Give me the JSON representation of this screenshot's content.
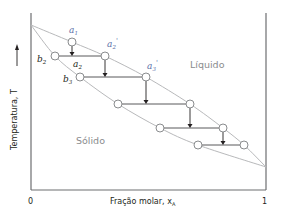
{
  "diagram": {
    "type": "phase-diagram",
    "title": "",
    "colors": {
      "axis": "#6d6e71",
      "curve": "#b8b9bb",
      "tie_line": "#58595b",
      "arrow": "#231f20",
      "point_fill": "#ffffff",
      "point_stroke": "#8a8c8e",
      "region_label": "#8a8c8e",
      "point_label_blue": "#5b6fa8",
      "point_label_black": "#231f20",
      "axis_label": "#231f20"
    },
    "axes": {
      "y_label": "Temperatura, T",
      "x_label_text": "Fração molar, x",
      "x_label_subscript": "A",
      "x_tick_min": "0",
      "x_tick_max": "1"
    },
    "regions": {
      "liquid": "Líquido",
      "solid": "Sólido"
    },
    "curves": {
      "liquidus": [
        [
          31,
          25
        ],
        [
          72,
          42
        ],
        [
          105,
          56
        ],
        [
          146,
          77
        ],
        [
          190,
          104
        ],
        [
          223,
          128
        ],
        [
          244,
          145
        ],
        [
          266,
          167
        ]
      ],
      "solidus": [
        [
          31,
          25
        ],
        [
          55,
          56
        ],
        [
          80,
          77
        ],
        [
          118,
          104
        ],
        [
          160,
          128
        ],
        [
          198,
          145
        ],
        [
          266,
          167
        ]
      ]
    },
    "points": [
      {
        "name": "a1",
        "x": 72,
        "y": 42,
        "label": "a",
        "sub": "1",
        "prime": "",
        "lx": 69,
        "ly": 33,
        "color": "blue"
      },
      {
        "name": "b2",
        "x": 55,
        "y": 56,
        "label": "b",
        "sub": "2",
        "prime": "",
        "lx": 37,
        "ly": 62,
        "color": "black"
      },
      {
        "name": "a2-prime",
        "x": 105,
        "y": 56,
        "label": "a",
        "sub": "2",
        "prime": "'",
        "lx": 107,
        "ly": 47,
        "color": "blue"
      },
      {
        "name": "b3",
        "x": 80,
        "y": 77,
        "label": "b",
        "sub": "3",
        "prime": "",
        "lx": 63,
        "ly": 82,
        "color": "black"
      },
      {
        "name": "a3-prime",
        "x": 146,
        "y": 77,
        "label": "a",
        "sub": "3",
        "prime": "'",
        "lx": 147,
        "ly": 69,
        "color": "blue"
      },
      {
        "name": "s4",
        "x": 118,
        "y": 104
      },
      {
        "name": "l4",
        "x": 190,
        "y": 104
      },
      {
        "name": "s5",
        "x": 160,
        "y": 128
      },
      {
        "name": "l5",
        "x": 223,
        "y": 128
      },
      {
        "name": "s6",
        "x": 198,
        "y": 145
      },
      {
        "name": "l6",
        "x": 244,
        "y": 145
      }
    ],
    "a2_label": {
      "label": "a",
      "sub": "2",
      "lx": 73,
      "ly": 67
    },
    "tie_lines": [
      {
        "x1": 55,
        "y1": 56,
        "x2": 105,
        "y2": 56
      },
      {
        "x1": 80,
        "y1": 77,
        "x2": 146,
        "y2": 77
      },
      {
        "x1": 118,
        "y1": 104,
        "x2": 190,
        "y2": 104
      },
      {
        "x1": 160,
        "y1": 128,
        "x2": 223,
        "y2": 128
      },
      {
        "x1": 198,
        "y1": 145,
        "x2": 244,
        "y2": 145
      }
    ],
    "arrows": [
      {
        "x": 72,
        "y1": 46,
        "y2": 56
      },
      {
        "x": 105,
        "y1": 60,
        "y2": 77
      },
      {
        "x": 146,
        "y1": 81,
        "y2": 104
      },
      {
        "x": 190,
        "y1": 108,
        "y2": 128
      },
      {
        "x": 223,
        "y1": 132,
        "y2": 145
      }
    ]
  }
}
